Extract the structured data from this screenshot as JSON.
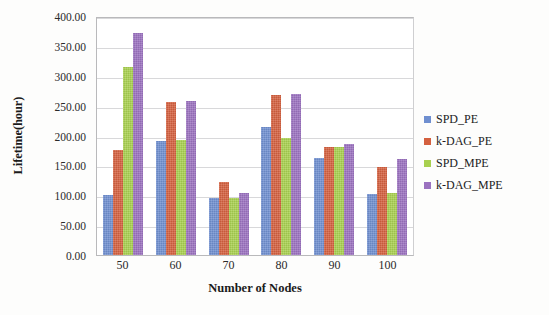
{
  "chart_data": {
    "type": "bar",
    "title": "",
    "xlabel": "Number of Nodes",
    "ylabel": "Lifetime(hour)",
    "categories": [
      "50",
      "60",
      "70",
      "80",
      "90",
      "100"
    ],
    "series": [
      {
        "name": "SPD_PE",
        "color": "#6f8fd0",
        "values": [
          100,
          190,
          95,
          215,
          163,
          102
        ]
      },
      {
        "name": "k-DAG_PE",
        "color": "#d4603f",
        "values": [
          176,
          256,
          122,
          268,
          180,
          148
        ]
      },
      {
        "name": "SPD_MPE",
        "color": "#a8d04f",
        "values": [
          314,
          193,
          95,
          196,
          180,
          103
        ]
      },
      {
        "name": "k-DAG_MPE",
        "color": "#9b72c0",
        "values": [
          372,
          257,
          103,
          270,
          186,
          160
        ]
      }
    ],
    "ylim": [
      0,
      400
    ],
    "ytick_values": [
      0,
      50,
      100,
      150,
      200,
      250,
      300,
      350,
      400
    ],
    "ytick_labels": [
      "0.00",
      "50.00",
      "100.00",
      "150.00",
      "200.00",
      "250.00",
      "300.00",
      "350.00",
      "400.00"
    ],
    "grid": true,
    "grid_axis": "y",
    "legend_position": "right",
    "legend": [
      "SPD_PE",
      "k-DAG_PE",
      "SPD_MPE",
      "k-DAG_MPE"
    ]
  }
}
